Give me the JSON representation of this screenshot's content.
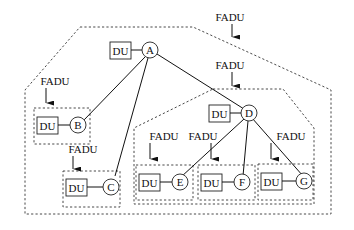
{
  "diagram": {
    "type": "tree-with-grouping",
    "unit_label": "DU",
    "group_label": "FADU",
    "nodes": [
      {
        "id": "A",
        "label": "A",
        "du_label": "DU"
      },
      {
        "id": "B",
        "label": "B",
        "du_label": "DU"
      },
      {
        "id": "C",
        "label": "C",
        "du_label": "DU"
      },
      {
        "id": "D",
        "label": "D",
        "du_label": "DU"
      },
      {
        "id": "E",
        "label": "E",
        "du_label": "DU"
      },
      {
        "id": "F",
        "label": "F",
        "du_label": "DU"
      },
      {
        "id": "G",
        "label": "G",
        "du_label": "DU"
      }
    ],
    "edges": [
      {
        "from": "A",
        "to": "B"
      },
      {
        "from": "A",
        "to": "C"
      },
      {
        "from": "A",
        "to": "D"
      },
      {
        "from": "D",
        "to": "E"
      },
      {
        "from": "D",
        "to": "F"
      },
      {
        "from": "D",
        "to": "G"
      }
    ],
    "groups": [
      {
        "id": "outer",
        "label": "FADU",
        "contains": [
          "A",
          "B",
          "C",
          "D",
          "E",
          "F",
          "G"
        ]
      },
      {
        "id": "B-group",
        "label": "FADU",
        "contains": [
          "B"
        ]
      },
      {
        "id": "C-group",
        "label": "FADU",
        "contains": [
          "C"
        ]
      },
      {
        "id": "D-group",
        "label": "FADU",
        "contains": [
          "D",
          "E",
          "F",
          "G"
        ]
      },
      {
        "id": "E-group",
        "label": "FADU",
        "contains": [
          "E"
        ]
      },
      {
        "id": "F-group",
        "label": "FADU",
        "contains": [
          "F"
        ]
      },
      {
        "id": "G-group",
        "label": "FADU",
        "contains": [
          "G"
        ]
      }
    ]
  },
  "labels": {
    "A": "A",
    "B": "B",
    "C": "C",
    "D": "D",
    "E": "E",
    "F": "F",
    "G": "G",
    "du": "DU",
    "fadu": "FADU"
  }
}
